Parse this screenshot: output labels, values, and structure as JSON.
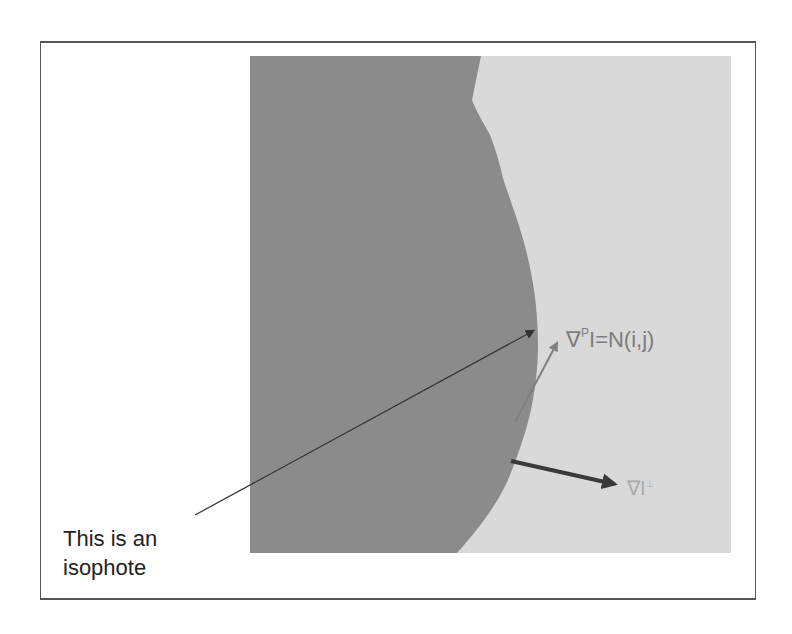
{
  "figure": {
    "caption_line1": "This is an",
    "caption_line2": "isophote",
    "normal_label": {
      "nabla": "∇",
      "superscript": "P",
      "rest": "I=N(i,j)"
    },
    "gradient_label": {
      "nabla": "∇",
      "symbol": "I",
      "superscript": "⊥"
    },
    "colors": {
      "dark_region": "#8b8b8b",
      "light_region": "#d9d9d9",
      "isophote_arrow": "#333333",
      "normal_arrow": "#808080",
      "gradient_arrow": "#3a3a3a",
      "frame": "#555555"
    },
    "arrows": [
      {
        "name": "isophote-pointer",
        "from": [
          195,
          515
        ],
        "to": [
          537,
          329
        ]
      },
      {
        "name": "normal-vector",
        "from": [
          515,
          422
        ],
        "to": [
          560,
          338
        ]
      },
      {
        "name": "gradient-vector",
        "from": [
          511,
          461
        ],
        "to": [
          622,
          486
        ]
      }
    ]
  }
}
